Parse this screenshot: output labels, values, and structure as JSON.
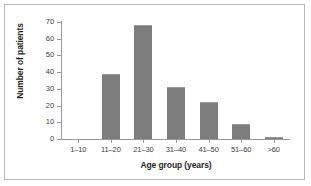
{
  "chart_data": {
    "type": "bar",
    "title": "",
    "subtitle": "",
    "xlabel": "Age group (years)",
    "ylabel": "Number of patients",
    "categories": [
      "1–10",
      "11–20",
      "21–30",
      "31–40",
      "41–50",
      "51–60",
      ">60"
    ],
    "values": [
      0,
      39,
      68,
      31,
      22,
      9,
      1
    ],
    "ylim": [
      0,
      70
    ],
    "yticks": [
      0,
      10,
      20,
      30,
      40,
      50,
      60,
      70
    ],
    "ytick_labels": [
      "0",
      "10",
      "20",
      "30",
      "40",
      "50",
      "60",
      "70"
    ],
    "grid": false,
    "legend": false,
    "legend_position": "none",
    "bar_color": "#7d7d7d",
    "axis_color": "#9a9a9a",
    "frame_color": "#b9b9b9",
    "background_color": "#ffffff",
    "text_color": "#3b3b3b"
  }
}
